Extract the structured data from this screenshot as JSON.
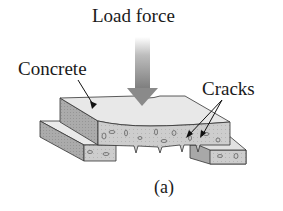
{
  "diagram": {
    "labels": {
      "load_force": "Load force",
      "concrete": "Concrete",
      "cracks": "Cracks",
      "caption": "(a)"
    },
    "colors": {
      "top_surface": "#e6e6e6",
      "side_face": "#a8a8a8",
      "front_face": "#cfcfcf",
      "arrow": "#8a8a8a",
      "ink": "#1a1a1a"
    }
  }
}
